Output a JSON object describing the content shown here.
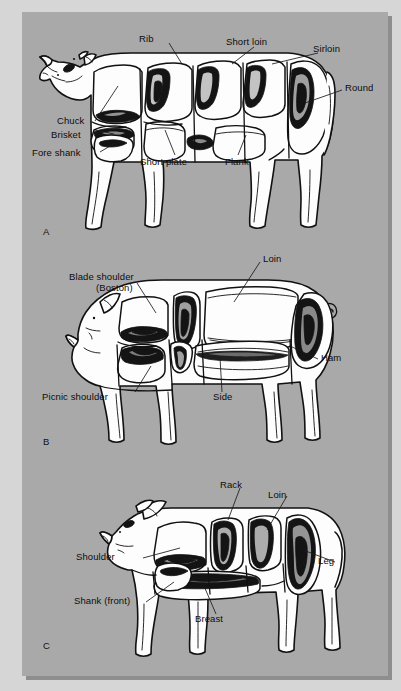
{
  "document": {
    "title": "Retail cuts of beef, pork, and lamb",
    "background_color": "#a9a9a9",
    "page_color": "#d6d6d6",
    "ink_color": "#111111"
  },
  "panels": [
    {
      "letter": "A",
      "name": "beef-carcass-diagram",
      "animal": "beef",
      "labels": [
        {
          "text": "Rib",
          "name": "label-rib"
        },
        {
          "text": "Short loin",
          "name": "label-short-loin"
        },
        {
          "text": "Sirloin",
          "name": "label-sirloin"
        },
        {
          "text": "Round",
          "name": "label-round"
        },
        {
          "text": "Chuck",
          "name": "label-chuck"
        },
        {
          "text": "Brisket",
          "name": "label-brisket"
        },
        {
          "text": "Fore shank",
          "name": "label-fore-shank"
        },
        {
          "text": "Short plate",
          "name": "label-short-plate"
        },
        {
          "text": "Flank",
          "name": "label-flank"
        }
      ]
    },
    {
      "letter": "B",
      "name": "pork-carcass-diagram",
      "animal": "pork",
      "labels": [
        {
          "text": "Blade shoulder",
          "name": "label-blade-shoulder"
        },
        {
          "text": "(Boston)",
          "name": "label-blade-shoulder-boston"
        },
        {
          "text": "Loin",
          "name": "label-loin"
        },
        {
          "text": "Ham",
          "name": "label-ham"
        },
        {
          "text": "Side",
          "name": "label-side"
        },
        {
          "text": "Picnic shoulder",
          "name": "label-picnic-shoulder"
        }
      ]
    },
    {
      "letter": "C",
      "name": "lamb-carcass-diagram",
      "animal": "lamb",
      "labels": [
        {
          "text": "Rack",
          "name": "label-rack"
        },
        {
          "text": "Loin",
          "name": "label-loin"
        },
        {
          "text": "Leg",
          "name": "label-leg"
        },
        {
          "text": "Shoulder",
          "name": "label-shoulder"
        },
        {
          "text": "Shank (front)",
          "name": "label-shank-front"
        },
        {
          "text": "Breast",
          "name": "label-breast"
        }
      ]
    }
  ]
}
